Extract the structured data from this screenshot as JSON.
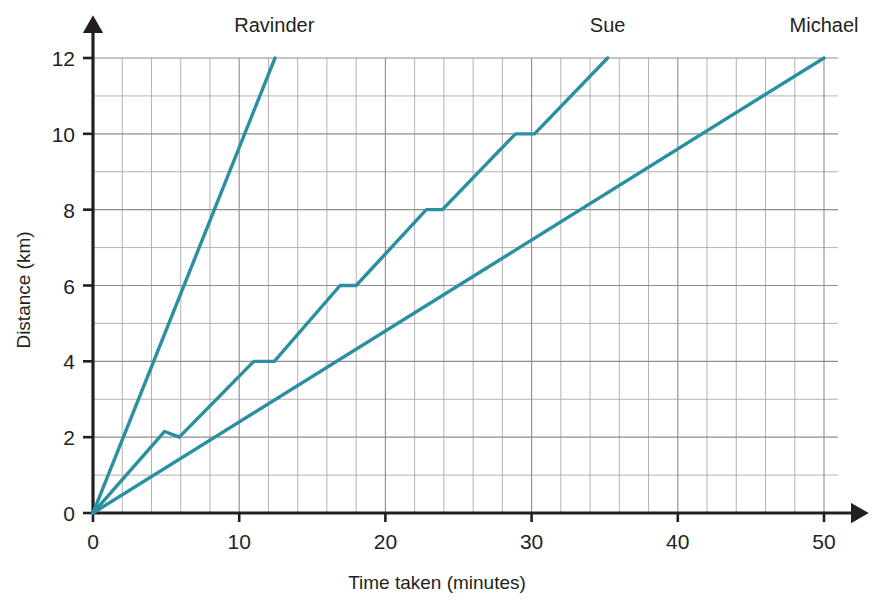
{
  "chart_data": {
    "type": "line",
    "title": "",
    "xlabel": "Time taken (minutes)",
    "ylabel": "Distance (km)",
    "xlim": [
      0,
      50
    ],
    "ylim": [
      0,
      12
    ],
    "xticks": [
      0,
      10,
      20,
      30,
      40,
      50
    ],
    "yticks": [
      0,
      2,
      4,
      6,
      8,
      10,
      12
    ],
    "xtick_labels": [
      "0",
      "10",
      "20",
      "30",
      "40",
      "50"
    ],
    "ytick_labels": [
      "0",
      "2",
      "4",
      "6",
      "8",
      "10",
      "12"
    ],
    "x_minor_step": 2,
    "y_minor_step": 1,
    "grid": true,
    "legend": "inline-labels-above-line-ends",
    "line_color": "#2a8fa3",
    "axis_color": "#231f20",
    "grid_color": "#8c8c8c",
    "series": [
      {
        "name": "Ravinder",
        "label": "Ravinder",
        "label_x": 12.4,
        "label_y": 12,
        "points": [
          {
            "x": 0,
            "y": 0
          },
          {
            "x": 12.45,
            "y": 12
          }
        ]
      },
      {
        "name": "Sue",
        "label": "Sue",
        "label_x": 35.2,
        "label_y": 12,
        "points": [
          {
            "x": 0,
            "y": 0
          },
          {
            "x": 4.9,
            "y": 2.15
          },
          {
            "x": 5.9,
            "y": 2
          },
          {
            "x": 11.0,
            "y": 4
          },
          {
            "x": 12.4,
            "y": 4
          },
          {
            "x": 16.9,
            "y": 6
          },
          {
            "x": 18.0,
            "y": 6
          },
          {
            "x": 22.8,
            "y": 8
          },
          {
            "x": 23.9,
            "y": 8
          },
          {
            "x": 28.9,
            "y": 10
          },
          {
            "x": 30.2,
            "y": 10
          },
          {
            "x": 35.2,
            "y": 12
          }
        ]
      },
      {
        "name": "Michael",
        "label": "Michael",
        "label_x": 50,
        "label_y": 12,
        "points": [
          {
            "x": 0,
            "y": 0
          },
          {
            "x": 50,
            "y": 12
          }
        ]
      }
    ]
  }
}
